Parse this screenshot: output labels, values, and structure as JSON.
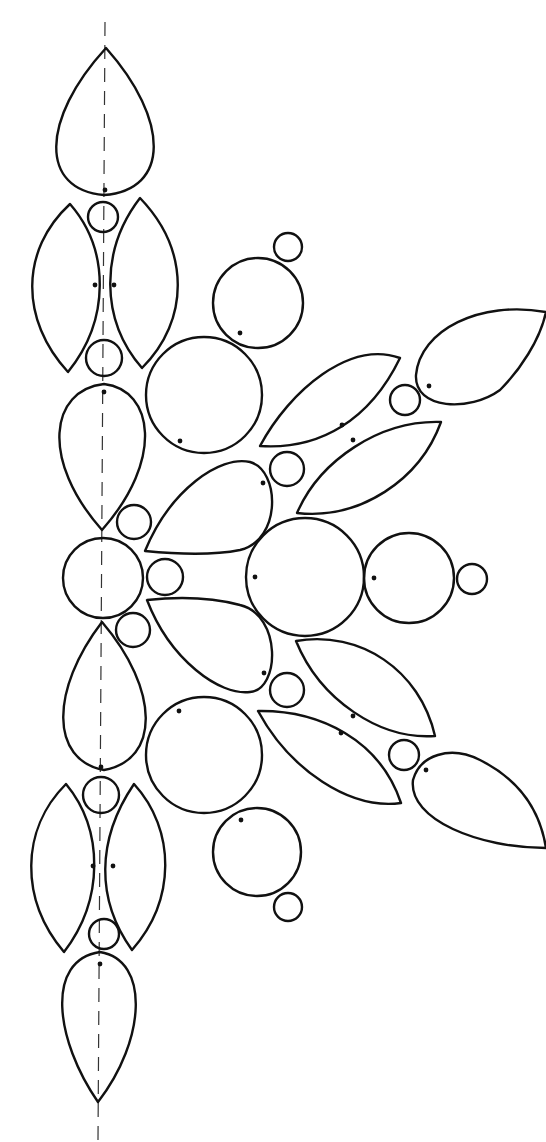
{
  "diagram": {
    "title": "",
    "width": 546,
    "height": 1142,
    "colors": {
      "line": "#111111",
      "background": "#ffffff",
      "axis": "#333333"
    },
    "axis": {
      "x1": 105,
      "y1": 22,
      "x2": 98,
      "y2": 1140,
      "style": "dashed",
      "label": "center-line"
    },
    "circles": [
      {
        "cx": 103,
        "cy": 217,
        "r": 15
      },
      {
        "cx": 104,
        "cy": 358,
        "r": 18
      },
      {
        "cx": 288,
        "cy": 247,
        "r": 14
      },
      {
        "cx": 258,
        "cy": 303,
        "r": 45
      },
      {
        "cx": 204,
        "cy": 395,
        "r": 58
      },
      {
        "cx": 405,
        "cy": 400,
        "r": 15
      },
      {
        "cx": 287,
        "cy": 469,
        "r": 17
      },
      {
        "cx": 134,
        "cy": 522,
        "r": 17
      },
      {
        "cx": 103,
        "cy": 578,
        "r": 40
      },
      {
        "cx": 165,
        "cy": 577,
        "r": 18
      },
      {
        "cx": 305,
        "cy": 577,
        "r": 59
      },
      {
        "cx": 409,
        "cy": 578,
        "r": 45
      },
      {
        "cx": 472,
        "cy": 579,
        "r": 15
      },
      {
        "cx": 133,
        "cy": 630,
        "r": 17
      },
      {
        "cx": 287,
        "cy": 690,
        "r": 17
      },
      {
        "cx": 204,
        "cy": 755,
        "r": 58
      },
      {
        "cx": 404,
        "cy": 755,
        "r": 15
      },
      {
        "cx": 257,
        "cy": 852,
        "r": 44
      },
      {
        "cx": 288,
        "cy": 907,
        "r": 14
      },
      {
        "cx": 101,
        "cy": 795,
        "r": 18
      },
      {
        "cx": 104,
        "cy": 934,
        "r": 15
      }
    ],
    "shapes": [
      {
        "type": "drop",
        "d": "M106 48 C 40 120, 40 190, 104 195 C 170 190, 170 120, 106 48 Z"
      },
      {
        "type": "leaf",
        "d": "M70 204 C 20 250, 20 320, 68 372 C 110 320, 110 250, 70 204 Z"
      },
      {
        "type": "leaf",
        "d": "M140 198 C 100 250, 100 320, 142 368 C 190 320, 190 250, 140 198 Z"
      },
      {
        "type": "drop",
        "d": "M104 384 C 50 390, 40 460, 102 530 C 164 460, 154 390, 104 384 Z"
      },
      {
        "type": "leaf",
        "d": "M260 446 C 290 390, 350 340, 400 358 C 370 420, 320 450, 260 446 Z"
      },
      {
        "type": "drop",
        "d": "M546 312 C 480 300, 420 330, 416 375 C 414 410, 470 412, 500 390 C 520 370, 540 340, 546 312 Z"
      },
      {
        "type": "leaf",
        "d": "M297 513 C 320 460, 380 420, 441 422 C 420 480, 360 520, 297 513 Z"
      },
      {
        "type": "drop",
        "d": "M145 551 C 170 490, 220 455, 250 462 C 280 470, 282 540, 240 550 C 210 556, 175 554, 145 551 Z"
      },
      {
        "type": "drop",
        "d": "M102 622 C 50 690, 50 760, 104 770 C 160 760, 160 690, 102 622 Z"
      },
      {
        "type": "drop",
        "d": "M147 600 C 175 597, 210 597, 240 605 C 282 615, 280 690, 250 692 C 220 696, 170 660, 147 600 Z"
      },
      {
        "type": "leaf",
        "d": "M296 641 C 360 630, 420 670, 435 736 C 380 740, 320 700, 296 641 Z"
      },
      {
        "type": "leaf",
        "d": "M258 711 C 320 710, 380 740, 401 803 C 350 810, 290 770, 258 711 Z"
      },
      {
        "type": "drop",
        "d": "M546 848 C 540 810, 520 780, 480 760 C 450 745, 420 755, 413 780 C 408 820, 480 848, 546 848 Z"
      },
      {
        "type": "leaf",
        "d": "M66 784 C 20 830, 20 900, 64 952 C 104 900, 104 830, 66 784 Z"
      },
      {
        "type": "leaf",
        "d": "M134 784 C 96 840, 96 900, 132 950 C 176 900, 176 830, 134 784 Z"
      },
      {
        "type": "drop",
        "d": "M100 952 C 45 960, 55 1040, 98 1102 C 146 1040, 150 960, 100 952 Z"
      }
    ],
    "dots": [
      {
        "cx": 105,
        "cy": 190
      },
      {
        "cx": 95,
        "cy": 285
      },
      {
        "cx": 114,
        "cy": 285
      },
      {
        "cx": 240,
        "cy": 333
      },
      {
        "cx": 104,
        "cy": 392
      },
      {
        "cx": 180,
        "cy": 441
      },
      {
        "cx": 342,
        "cy": 425
      },
      {
        "cx": 353,
        "cy": 440
      },
      {
        "cx": 429,
        "cy": 386
      },
      {
        "cx": 263,
        "cy": 483
      },
      {
        "cx": 255,
        "cy": 577
      },
      {
        "cx": 374,
        "cy": 578
      },
      {
        "cx": 264,
        "cy": 673
      },
      {
        "cx": 179,
        "cy": 711
      },
      {
        "cx": 353,
        "cy": 716
      },
      {
        "cx": 341,
        "cy": 733
      },
      {
        "cx": 426,
        "cy": 770
      },
      {
        "cx": 241,
        "cy": 820
      },
      {
        "cx": 101,
        "cy": 767
      },
      {
        "cx": 93,
        "cy": 866
      },
      {
        "cx": 113,
        "cy": 866
      },
      {
        "cx": 100,
        "cy": 964
      }
    ]
  }
}
